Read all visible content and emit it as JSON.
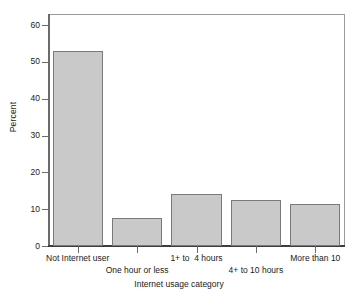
{
  "chart_data": {
    "type": "bar",
    "title": "",
    "xlabel": "Internet usage category",
    "ylabel": "Percent",
    "categories": [
      "Not Internet user",
      "One hour or less",
      "1+ to  4 hours",
      "4+ to 10 hours",
      "More than 10"
    ],
    "values": [
      53.0,
      7.5,
      14.0,
      12.6,
      11.4
    ],
    "ylim": [
      0,
      63
    ],
    "yticks": [
      0,
      10,
      20,
      30,
      40,
      50,
      60
    ],
    "ytick_labels": [
      "0",
      "10",
      "20",
      "30",
      "40",
      "50",
      "60"
    ],
    "grid": false,
    "legend": false,
    "bar_color": "#c9c9c9",
    "bar_edge_color": "#7a7a7a",
    "axis_color": "#6b6b6b",
    "label_rows": [
      0,
      1,
      0,
      1,
      0
    ]
  }
}
